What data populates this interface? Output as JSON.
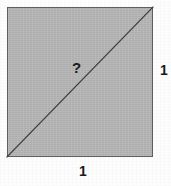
{
  "figure": {
    "name": "unit-square-with-diagonal",
    "background_color": "#fdfdfd",
    "square": {
      "fill_color": "#b6b6b6",
      "border_color": "#5e5e5e",
      "border_width_px": 1,
      "x_px": 7,
      "y_px": 7,
      "width_px": 146,
      "height_px": 150
    },
    "diagonal": {
      "stroke_color": "#3a3a3a",
      "stroke_width_px": 1.2,
      "from_corner": "bottom-left",
      "to_corner": "top-right",
      "x1_px": 7,
      "y1_px": 157,
      "x2_px": 153,
      "y2_px": 7
    },
    "labels": {
      "diagonal": "?",
      "right_side": "1",
      "bottom_side": "1"
    }
  }
}
